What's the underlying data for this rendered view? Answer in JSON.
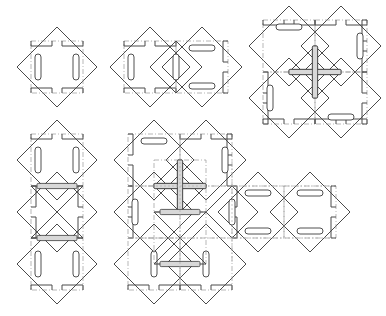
{
  "figure": {
    "canvas": {
      "width": 386,
      "height": 316,
      "background": "#ffffff"
    },
    "style": {
      "edge_color": "#4a4a4a",
      "fold_color": "#9a9a9a",
      "slot_fill": "#ffffff",
      "slot_stroke": "#3c3c3c",
      "band_fill": "#d8d8d8"
    },
    "module": {
      "name": "diamond-tile",
      "half_diagonal": 40,
      "inner_square_half": 26,
      "slot_length": 26,
      "slot_width": 6,
      "tab_depth": 5,
      "tab_gap": 8
    },
    "panels": [
      {
        "id": "panel-1",
        "label": "single-tile",
        "origin": {
          "x": 57,
          "y": 67
        },
        "tile_count": 1,
        "tiles": [
          {
            "name": "tile-a",
            "cx": 0,
            "cy": 0,
            "slots": "vertical",
            "tabs": "top-bottom",
            "core": "none"
          }
        ]
      },
      {
        "id": "panel-2",
        "label": "two-tile-pair",
        "origin": {
          "x": 150,
          "y": 67
        },
        "tile_count": 3,
        "tiles": [
          {
            "name": "tile-a",
            "cx": 0,
            "cy": 0,
            "slots": "vertical",
            "tabs": "top-bottom",
            "core": "none"
          },
          {
            "name": "tile-b",
            "cx": 52,
            "cy": 0,
            "slots": "horizontal",
            "tabs": "right",
            "core": "none"
          },
          {
            "name": "tile-core",
            "cx": 26,
            "cy": 0,
            "slots": "center-vertical",
            "tabs": "none",
            "core": "half-diamond"
          }
        ]
      },
      {
        "id": "panel-3",
        "label": "four-tile-pinwheel",
        "origin": {
          "x": 315,
          "y": 72
        },
        "tile_count": 4,
        "tiles": [
          {
            "name": "tile-nw",
            "cx": -26,
            "cy": -26,
            "slots": "horizontal",
            "tabs": "top",
            "core": "none"
          },
          {
            "name": "tile-ne",
            "cx": 26,
            "cy": -26,
            "slots": "vertical",
            "tabs": "right",
            "core": "none"
          },
          {
            "name": "tile-sw",
            "cx": -26,
            "cy": 26,
            "slots": "vertical",
            "tabs": "left",
            "core": "none"
          },
          {
            "name": "tile-se",
            "cx": 26,
            "cy": 26,
            "slots": "horizontal",
            "tabs": "bottom",
            "core": "none"
          }
        ],
        "center_motif": "pinwheel-four-blade"
      },
      {
        "id": "panel-4",
        "label": "vertical-stack",
        "origin": {
          "x": 57,
          "y": 212
        },
        "tile_count": 3,
        "tiles": [
          {
            "name": "tile-top",
            "cx": 0,
            "cy": -52,
            "slots": "vertical",
            "tabs": "top",
            "core": "none"
          },
          {
            "name": "tile-mid",
            "cx": 0,
            "cy": 0,
            "slots": "none",
            "tabs": "left-right",
            "core": "bowtie-x"
          },
          {
            "name": "tile-bottom",
            "cx": 0,
            "cy": 52,
            "slots": "vertical",
            "tabs": "bottom",
            "core": "none"
          }
        ],
        "center_motif": "bowtie-x"
      },
      {
        "id": "panel-5",
        "label": "full-assembly",
        "origin": {
          "x": 232,
          "y": 212
        },
        "tile_count": 7,
        "tiles": [
          {
            "name": "tile-nw",
            "cx": -78,
            "cy": -52,
            "slots": "horizontal",
            "tabs": "top-left",
            "core": "none"
          },
          {
            "name": "tile-n",
            "cx": -26,
            "cy": -52,
            "slots": "vertical",
            "tabs": "top",
            "core": "none"
          },
          {
            "name": "tile-w",
            "cx": -78,
            "cy": 0,
            "slots": "vertical",
            "tabs": "left",
            "core": "none"
          },
          {
            "name": "tile-center-upper",
            "cx": -52,
            "cy": -26,
            "slots": "none",
            "tabs": "none",
            "core": "pinwheel-four-blade"
          },
          {
            "name": "tile-center-lower",
            "cx": -52,
            "cy": 26,
            "slots": "none",
            "tabs": "none",
            "core": "bowtie-x"
          },
          {
            "name": "tile-sw",
            "cx": -78,
            "cy": 52,
            "slots": "vertical",
            "tabs": "bottom-left",
            "core": "none"
          },
          {
            "name": "tile-s",
            "cx": -26,
            "cy": 52,
            "slots": "vertical",
            "tabs": "bottom",
            "core": "none"
          },
          {
            "name": "tile-e",
            "cx": 26,
            "cy": 0,
            "slots": "horizontal",
            "tabs": "left",
            "core": "none"
          },
          {
            "name": "tile-far-e",
            "cx": 78,
            "cy": 0,
            "slots": "horizontal",
            "tabs": "right",
            "core": "none"
          }
        ],
        "center_motif": "pinwheel-and-bowtie"
      }
    ]
  }
}
